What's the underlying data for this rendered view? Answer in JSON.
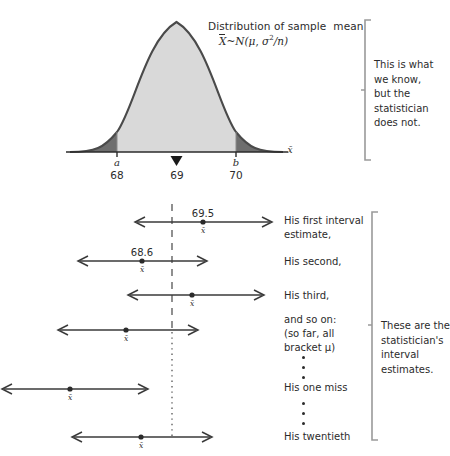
{
  "figure": {
    "distribution": {
      "title": "Distribution of sample  mean",
      "formula_parts": {
        "xbar": "X",
        "tilde": "~",
        "dist": "N(",
        "mu": "μ",
        "comma": ", ",
        "sigma": "σ",
        "exponent": "2",
        "over_n": "/n)"
      },
      "axis_label": "x̄",
      "ticks": [
        {
          "symbol": "a",
          "value": "68"
        },
        {
          "symbol": "",
          "value": "69"
        },
        {
          "symbol": "b",
          "value": "70"
        }
      ],
      "center_marker": "triangle-up",
      "colors": {
        "body_fill": "#d9d9d9",
        "tail_fill": "#6e6e6e",
        "curve_stroke": "#4a4a4a",
        "axis": "#2b2b2b"
      }
    },
    "know_note": "This is what\nwe know,\nbut the\nstatistician\ndoes not.",
    "estimates_note": "These are the\nstatistician's\ninterval\nestimates.",
    "mu_line": {
      "style_upper": "dashed",
      "style_lower": "dotted",
      "color": "#555555"
    },
    "intervals": [
      {
        "label": "His first interval\nestimate,",
        "value": "69.5",
        "xbar": "x̄",
        "brackets_mu": true
      },
      {
        "label": "His second,",
        "value": "68.6",
        "xbar": "x̄",
        "brackets_mu": true
      },
      {
        "label": "His third,",
        "value": "",
        "xbar": "x̄",
        "brackets_mu": true
      },
      {
        "label": "and so on:\n(so far, all\nbracket μ)",
        "value": "",
        "xbar": "x̄",
        "brackets_mu": true
      },
      {
        "label": "His one miss",
        "value": "",
        "xbar": "x̄",
        "brackets_mu": false
      },
      {
        "label": "His twentieth",
        "value": "",
        "xbar": "x̄",
        "brackets_mu": true
      }
    ],
    "ellipses": [
      {
        "id": "ellipsis-upper",
        "dots": 3
      },
      {
        "id": "ellipsis-lower",
        "dots": 3
      }
    ]
  }
}
